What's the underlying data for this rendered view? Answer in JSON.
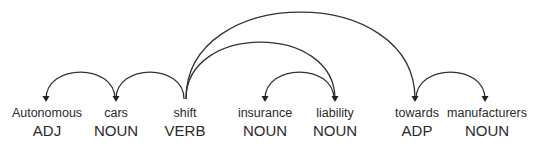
{
  "diagram": {
    "type": "dependency-parse",
    "tokens": [
      {
        "text": "Autonomous",
        "tag": "ADJ"
      },
      {
        "text": "cars",
        "tag": "NOUN"
      },
      {
        "text": "shift",
        "tag": "VERB"
      },
      {
        "text": "insurance",
        "tag": "NOUN"
      },
      {
        "text": "liability",
        "tag": "NOUN"
      },
      {
        "text": "towards",
        "tag": "ADP"
      },
      {
        "text": "manufacturers",
        "tag": "NOUN"
      }
    ],
    "arcs": [
      {
        "head": 1,
        "dependent": 0
      },
      {
        "head": 2,
        "dependent": 1
      },
      {
        "head": 4,
        "dependent": 3
      },
      {
        "head": 5,
        "dependent": 6
      },
      {
        "head": 2,
        "dependent": 4
      },
      {
        "head": 2,
        "dependent": 5
      }
    ],
    "colors": {
      "text": "#2a2a2a",
      "arc": "#333333",
      "background": "#ffffff"
    }
  }
}
